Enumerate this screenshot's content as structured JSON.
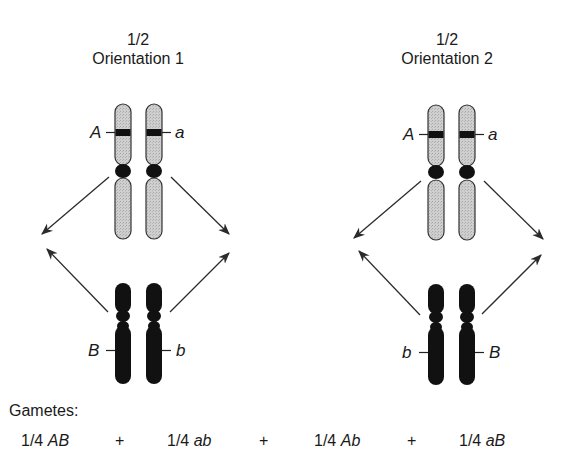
{
  "orientations": [
    {
      "fraction": "1/2",
      "label": "Orientation 1",
      "top_pair": {
        "left_allele": "A",
        "right_allele": "a"
      },
      "bottom_pair": {
        "left_allele": "B",
        "right_allele": "b"
      }
    },
    {
      "fraction": "1/2",
      "label": "Orientation 2",
      "top_pair": {
        "left_allele": "A",
        "right_allele": "a"
      },
      "bottom_pair": {
        "left_allele": "b",
        "right_allele": "B"
      }
    }
  ],
  "gametes": {
    "label": "Gametes:",
    "items": [
      {
        "fraction": "1/4",
        "genotype": "AB"
      },
      {
        "fraction": "1/4",
        "genotype": "ab"
      },
      {
        "fraction": "1/4",
        "genotype": "Ab"
      },
      {
        "fraction": "1/4",
        "genotype": "aB"
      }
    ],
    "operator": "+"
  },
  "colors": {
    "light_chromosome": "#c8c8c8",
    "dark_chromosome": "#111111",
    "outline": "#333333",
    "arrow": "#333333"
  }
}
